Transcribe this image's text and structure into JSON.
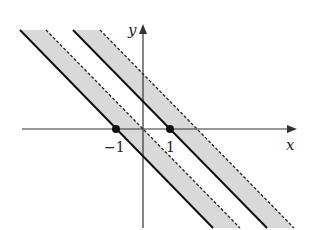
{
  "figure": {
    "axes": {
      "x_label": "x",
      "y_label": "y"
    },
    "ticks": [
      {
        "value": -1,
        "label": "−1"
      },
      {
        "value": 1,
        "label": "1"
      }
    ],
    "points": [
      {
        "x": -1,
        "y": 0
      },
      {
        "x": 1,
        "y": 0
      }
    ],
    "bands": [
      {
        "solid_line": "x + y = -1",
        "dashed_line": "x + y = 0",
        "shaded": true
      },
      {
        "solid_line": "x + y = 1",
        "dashed_line": "x + y = 2",
        "shaded": true
      }
    ],
    "colors": {
      "shade": "#d9d9d9",
      "line": "#111111",
      "axis": "#333333"
    }
  }
}
